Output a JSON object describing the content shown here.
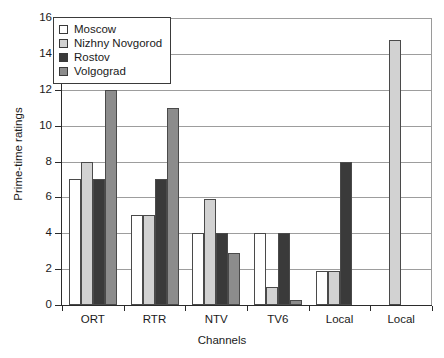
{
  "chart_data": {
    "type": "bar",
    "title": "",
    "xlabel": "Channels",
    "ylabel": "Prime-time ratings",
    "ylim": [
      0,
      16
    ],
    "ytick_step": 2,
    "yticks": [
      0,
      2,
      4,
      6,
      8,
      10,
      12,
      14,
      16
    ],
    "ytick_labels": [
      "0",
      "2",
      "4",
      "6",
      "8",
      "10",
      "12",
      "14",
      "16"
    ],
    "grid": "horizontal",
    "legend_position": "upper-left-inside",
    "categories": [
      "ORT",
      "RTR",
      "NTV",
      "TV6",
      "Local",
      "Local"
    ],
    "series": [
      {
        "name": "Moscow",
        "color": "#ffffff",
        "values": [
          7.0,
          5.0,
          4.0,
          4.0,
          1.9,
          null
        ]
      },
      {
        "name": "Nizhny Novgorod",
        "color": "#d2d2d2",
        "values": [
          8.0,
          5.0,
          5.9,
          1.0,
          1.9,
          14.8
        ]
      },
      {
        "name": "Rostov",
        "color": "#3a3a3a",
        "values": [
          7.0,
          7.0,
          4.0,
          4.0,
          8.0,
          null
        ]
      },
      {
        "name": "Volgograd",
        "color": "#8c8c8c",
        "values": [
          12.0,
          11.0,
          2.9,
          0.3,
          null,
          null
        ]
      }
    ]
  },
  "legend": {
    "entries": [
      {
        "label": "Moscow",
        "color": "#ffffff"
      },
      {
        "label": "Nizhny Novgorod",
        "color": "#d2d2d2"
      },
      {
        "label": "Rostov",
        "color": "#3a3a3a"
      },
      {
        "label": "Volgograd",
        "color": "#8c8c8c"
      }
    ]
  },
  "axes": {
    "y_title": "Prime-time ratings",
    "x_title": "Channels"
  }
}
